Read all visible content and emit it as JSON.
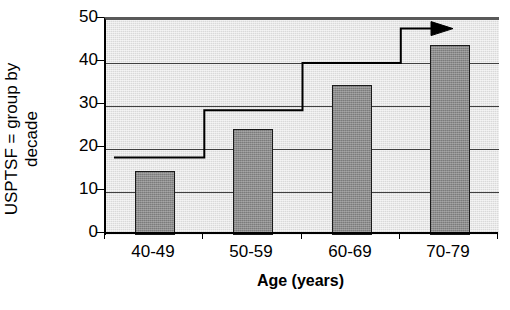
{
  "chart_data": {
    "type": "bar",
    "title": "",
    "xlabel": "Age (years)",
    "ylabel": "USPTSF = group by decade",
    "ylabel_lines": [
      "USPTSF = group by",
      "decade"
    ],
    "categories": [
      "40-49",
      "50-59",
      "60-69",
      "70-79"
    ],
    "values": [
      14.8,
      24.7,
      34.8,
      44.3
    ],
    "ylim": [
      0,
      50
    ],
    "yticks": [
      0,
      10,
      20,
      30,
      40,
      50
    ],
    "ytick_labels": [
      "0",
      "10",
      "20",
      "30",
      "40",
      "50"
    ],
    "grid": true,
    "grid_axis": "y",
    "legend": false,
    "legend_position": "none",
    "series": [
      {
        "name": "Observed rate",
        "kind": "bar",
        "values": [
          14.8,
          24.7,
          34.8,
          44.3
        ],
        "color": "#8c8c8c",
        "edge_color": "#1a1a1a"
      },
      {
        "name": "USPTSF group by decade threshold",
        "kind": "step",
        "values": [
          18,
          29,
          40,
          48
        ],
        "color": "#000000",
        "arrow_end": true,
        "arrow_direction": "right"
      }
    ],
    "annotations": [
      {
        "name": "trend-arrow",
        "kind": "arrow",
        "direction": "right",
        "at_category": "70-79",
        "at_value": 48
      }
    ],
    "colors": {
      "bar_fill": "#8c8c8c",
      "bar_edge": "#1a1a1a",
      "plot_background": "#d9d9d9",
      "gridline": "#404040",
      "axis": "#000000",
      "step_line": "#000000",
      "figure_background": "#ffffff"
    }
  }
}
